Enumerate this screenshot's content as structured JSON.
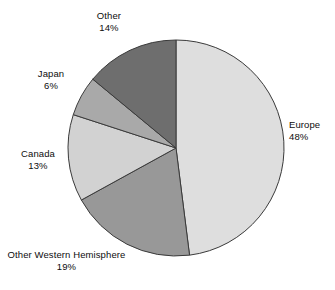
{
  "chart_data": {
    "type": "pie",
    "title": "",
    "subtitle": "",
    "xlabel": "",
    "ylabel": "",
    "legend_position": "none",
    "grid": false,
    "start_angle_deg": 0,
    "direction": "clockwise",
    "categories": [
      "Europe",
      "Other Western Hemisphere",
      "Canada",
      "Japan",
      "Other"
    ],
    "values": [
      48,
      19,
      13,
      6,
      14
    ],
    "value_unit": "%",
    "total": 100,
    "slices": [
      {
        "label": "Europe",
        "value": 48,
        "value_text": "48%",
        "color": "#dedede",
        "start_deg": 0,
        "end_deg": 172.8
      },
      {
        "label": "Other Western Hemisphere",
        "value": 19,
        "value_text": "19%",
        "color": "#989898",
        "start_deg": 172.8,
        "end_deg": 241.2
      },
      {
        "label": "Canada",
        "value": 13,
        "value_text": "13%",
        "color": "#d2d2d2",
        "start_deg": 241.2,
        "end_deg": 288.0
      },
      {
        "label": "Japan",
        "value": 6,
        "value_text": "6%",
        "color": "#a9a9a9",
        "start_deg": 288.0,
        "end_deg": 309.6
      },
      {
        "label": "Other",
        "value": 14,
        "value_text": "14%",
        "color": "#6e6e6e",
        "start_deg": 309.6,
        "end_deg": 360.0
      }
    ],
    "geometry": {
      "center_x": 176,
      "center_y": 148,
      "radius": 108
    },
    "style": {
      "background": "#ffffff",
      "slice_outline": "#3a3a3a",
      "text_color": "#0d0d0d"
    }
  }
}
